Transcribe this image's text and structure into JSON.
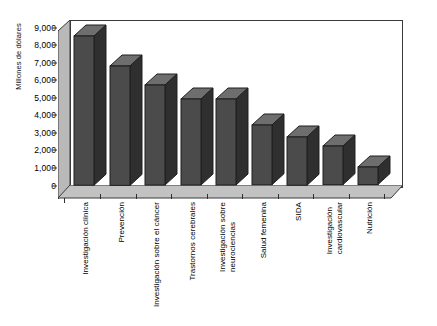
{
  "chart_data": {
    "type": "bar",
    "title": "",
    "subtitle": "",
    "xlabel": "",
    "ylabel": "Millones de dólares",
    "ylim": [
      0,
      9000
    ],
    "ytick_labels": [
      "9,000",
      "8,000",
      "7,000",
      "6,000",
      "5,000",
      "4,000",
      "3,000",
      "2,000",
      "1,000",
      "0"
    ],
    "ytick_values": [
      9000,
      8000,
      7000,
      6000,
      5000,
      4000,
      3000,
      2000,
      1000,
      0
    ],
    "grid": false,
    "legend": null,
    "style": "3d-bar",
    "categories": [
      "Investigación clínica",
      "Prevención",
      "Investigación sobre el cáncer",
      "Trastornos cerebrales",
      "Investigación sobre neurociencias",
      "Salud femenina",
      "SIDA",
      "Investigación cardiovascular",
      "Nutrición"
    ],
    "category_lines": [
      [
        "Investigación clínica"
      ],
      [
        "Prevención"
      ],
      [
        "Investigación sobre el cáncer"
      ],
      [
        "Trastornos cerebrales"
      ],
      [
        "Investigación sobre",
        "neurociencias"
      ],
      [
        "Salud femenina"
      ],
      [
        "SIDA"
      ],
      [
        "Investigación",
        "cardiovascular"
      ],
      [
        "Nutrición"
      ]
    ],
    "values": [
      8500,
      6800,
      5700,
      4900,
      4900,
      3400,
      2750,
      2200,
      1000
    ],
    "colors": {
      "bar_front": "#4b4b4b",
      "bar_side": "#2f2f2f",
      "bar_top": "#6e6e6e",
      "outline": "#1f1f1f",
      "floor": "#b9b9b9",
      "wall": "#ffffff",
      "axis": "#3a3a3a",
      "text": "#000000"
    }
  }
}
